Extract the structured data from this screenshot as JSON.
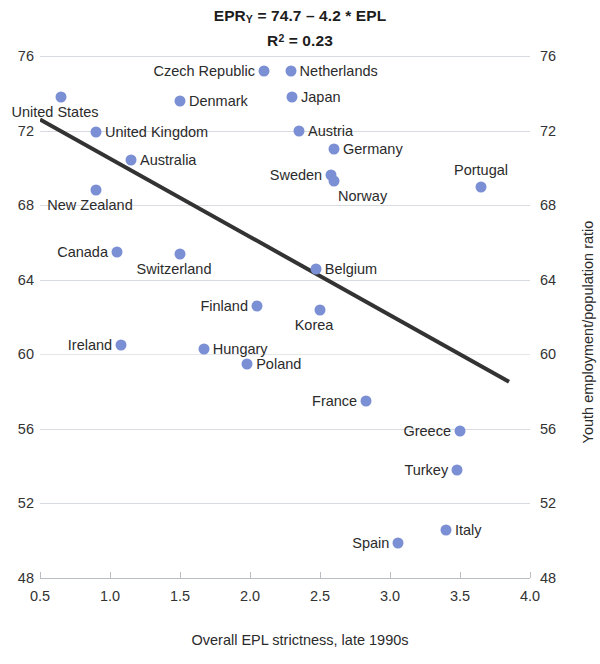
{
  "chart_data": {
    "type": "scatter",
    "title_line1_prefix": "EPR",
    "title_line1_sub": "Y",
    "title_line1_rest": " = 74.7 – 4.2 * EPL",
    "title_line2_prefix": "R",
    "title_line2_sup": "2",
    "title_line2_rest": " = 0.23",
    "xlabel": "Overall EPL strictness, late 1990s",
    "ylabel": "Youth employment/population ratio",
    "xlim": [
      0.5,
      4.0
    ],
    "ylim": [
      48,
      76
    ],
    "xticks": [
      "0.5",
      "1.0",
      "1.5",
      "2.0",
      "2.5",
      "3.0",
      "3.5",
      "4.0"
    ],
    "xtick_values": [
      0.5,
      1.0,
      1.5,
      2.0,
      2.5,
      3.0,
      3.5,
      4.0
    ],
    "yticks": [
      "48",
      "52",
      "56",
      "60",
      "64",
      "68",
      "72",
      "76"
    ],
    "ytick_values": [
      48,
      52,
      56,
      60,
      64,
      68,
      72,
      76
    ],
    "grid": true,
    "legend": "none",
    "marker_color": "#7b8fd4",
    "line_color": "#333333",
    "regression": {
      "intercept": 74.7,
      "slope": -4.2,
      "r_squared": 0.23,
      "x_start": 0.5,
      "x_end": 3.85
    },
    "points": [
      {
        "label": "United States",
        "x": 0.65,
        "y": 73.8,
        "label_side": "below"
      },
      {
        "label": "Czech Republic",
        "x": 2.1,
        "y": 75.2,
        "label_side": "left"
      },
      {
        "label": "Netherlands",
        "x": 2.29,
        "y": 75.2,
        "label_side": "right"
      },
      {
        "label": "Japan",
        "x": 2.3,
        "y": 73.8,
        "label_side": "right"
      },
      {
        "label": "Denmark",
        "x": 1.5,
        "y": 73.6,
        "label_side": "right"
      },
      {
        "label": "United Kingdom",
        "x": 0.9,
        "y": 71.9,
        "label_side": "right"
      },
      {
        "label": "Austria",
        "x": 2.35,
        "y": 72.0,
        "label_side": "right"
      },
      {
        "label": "Germany",
        "x": 2.6,
        "y": 71.0,
        "label_side": "right"
      },
      {
        "label": "Australia",
        "x": 1.15,
        "y": 70.4,
        "label_side": "right"
      },
      {
        "label": "Sweden",
        "x": 2.58,
        "y": 69.6,
        "label_side": "left"
      },
      {
        "label": "Norway",
        "x": 2.6,
        "y": 69.3,
        "label_side": "belowright"
      },
      {
        "label": "Portugal",
        "x": 3.65,
        "y": 69.0,
        "label_side": "above"
      },
      {
        "label": "New Zealand",
        "x": 0.9,
        "y": 68.8,
        "label_side": "below"
      },
      {
        "label": "Canada",
        "x": 1.05,
        "y": 65.5,
        "label_side": "left"
      },
      {
        "label": "Switzerland",
        "x": 1.5,
        "y": 65.4,
        "label_side": "below"
      },
      {
        "label": "Belgium",
        "x": 2.47,
        "y": 64.6,
        "label_side": "right"
      },
      {
        "label": "Finland",
        "x": 2.05,
        "y": 62.6,
        "label_side": "left"
      },
      {
        "label": "Korea",
        "x": 2.5,
        "y": 62.4,
        "label_side": "below"
      },
      {
        "label": "Ireland",
        "x": 1.08,
        "y": 60.5,
        "label_side": "left"
      },
      {
        "label": "Hungary",
        "x": 1.67,
        "y": 60.3,
        "label_side": "right"
      },
      {
        "label": "Poland",
        "x": 1.98,
        "y": 59.5,
        "label_side": "right"
      },
      {
        "label": "France",
        "x": 2.83,
        "y": 57.5,
        "label_side": "left"
      },
      {
        "label": "Greece",
        "x": 3.5,
        "y": 55.9,
        "label_side": "left"
      },
      {
        "label": "Turkey",
        "x": 3.48,
        "y": 53.8,
        "label_side": "left"
      },
      {
        "label": "Italy",
        "x": 3.4,
        "y": 50.6,
        "label_side": "right"
      },
      {
        "label": "Spain",
        "x": 3.06,
        "y": 49.9,
        "label_side": "left"
      }
    ]
  }
}
